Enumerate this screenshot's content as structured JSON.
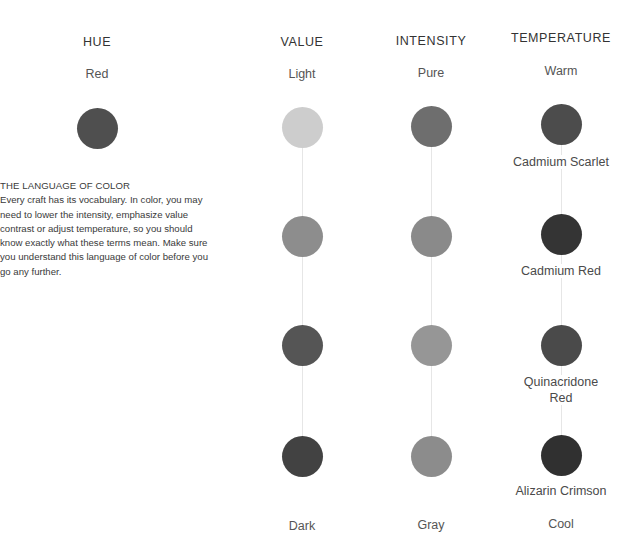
{
  "hue": {
    "heading": "HUE",
    "value": "Red",
    "swatch_color": "#4f4f4f"
  },
  "intro": {
    "title": "THE LANGUAGE OF COLOR",
    "body": "Every craft has its vocabulary. In color, you may need to lower the intensity, emphasize value contrast or adjust temperature, so you should know exactly what these terms mean. Make sure you understand this language of color before you go any further."
  },
  "columns": {
    "value": {
      "heading": "VALUE",
      "top_label": "Light",
      "bottom_label": "Dark",
      "swatches": [
        "#cdcdcd",
        "#8d8d8d",
        "#555555",
        "#424242"
      ]
    },
    "intensity": {
      "heading": "INTENSITY",
      "top_label": "Pure",
      "bottom_label": "Gray",
      "swatches": [
        "#6e6e6e",
        "#8a8a8a",
        "#969696",
        "#8c8c8c"
      ]
    },
    "temperature": {
      "heading": "TEMPERATURE",
      "top_label": "Warm",
      "bottom_label": "Cool",
      "swatches": [
        "#4c4c4c",
        "#343434",
        "#4a4a4a",
        "#303030"
      ],
      "paints": [
        "Cadmium Scarlet",
        "Cadmium Red",
        "Quinacridone Red",
        "Alizarin Crimson"
      ]
    }
  },
  "colors": {
    "connector": "#e6e6e6",
    "text": "#3a3a3a"
  }
}
